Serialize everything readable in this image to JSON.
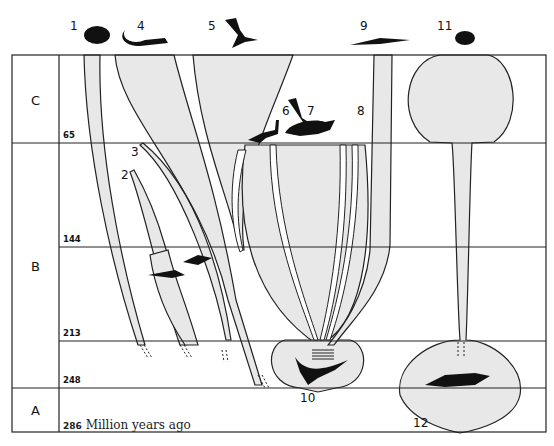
{
  "eras": [
    {
      "id": "C",
      "label": "C"
    },
    {
      "id": "B",
      "label": "B"
    },
    {
      "id": "A",
      "label": "A"
    }
  ],
  "time_ticks": [
    "65",
    "144",
    "213",
    "248",
    "286"
  ],
  "time_unit": "Million years ago",
  "lineages": [
    {
      "number": "1",
      "icon": "turtle-silhouette"
    },
    {
      "number": "2",
      "icon": "none"
    },
    {
      "number": "3",
      "icon": "none"
    },
    {
      "number": "4",
      "icon": "lizard-silhouette"
    },
    {
      "number": "5",
      "icon": "bird-silhouette"
    },
    {
      "number": "6",
      "icon": "small-dinosaur-silhouette"
    },
    {
      "number": "7",
      "icon": "triceratops-silhouette"
    },
    {
      "number": "8",
      "icon": "pterosaur-silhouette"
    },
    {
      "number": "9",
      "icon": "crocodile-silhouette"
    },
    {
      "number": "10",
      "icon": "thecodont-silhouette"
    },
    {
      "number": "11",
      "icon": "mammal-silhouette"
    },
    {
      "number": "12",
      "icon": "therapsid-silhouette"
    }
  ],
  "inline_icons": [
    "ichthyosaur-silhouette",
    "plesiosaur-silhouette"
  ],
  "colors": {
    "fill": "#e8e8e8",
    "line": "#222222",
    "silhouette": "#111111"
  }
}
